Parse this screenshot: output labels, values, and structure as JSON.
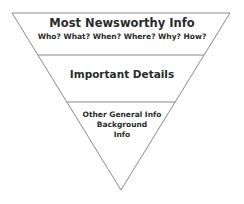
{
  "diagram": {
    "type": "inverted-pyramid",
    "colors": {
      "stroke": "#8a8a8a",
      "text": "#2b2b2b",
      "fill": "#ffffff"
    },
    "tiers": [
      {
        "title": "Most Newsworthy Info",
        "subtitle": "Who? What? When? Where? Why? How?"
      },
      {
        "title": "Important Details"
      },
      {
        "lines": [
          "Other General Info",
          "Background",
          "Info"
        ]
      }
    ]
  }
}
